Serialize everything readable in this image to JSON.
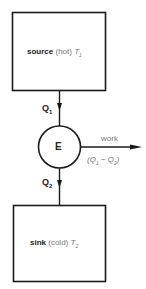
{
  "diagram": {
    "type": "heat-engine",
    "source": {
      "name": "source",
      "qualifier": "(hot)",
      "symbol": "T",
      "subscript": "1"
    },
    "heat_in": {
      "symbol": "Q",
      "subscript": "1"
    },
    "engine": {
      "label": "E"
    },
    "work": {
      "label": "work",
      "expr_open": "(",
      "q1": "Q",
      "q1_sub": "1",
      "minus": " − ",
      "q2": "Q",
      "q2_sub": "2",
      "expr_close": ")"
    },
    "heat_out": {
      "symbol": "Q",
      "subscript": "2"
    },
    "sink": {
      "name": "sink",
      "qualifier": "(cold)",
      "symbol": "T",
      "subscript": "2"
    },
    "colors": {
      "stroke": "#1a1a1a",
      "muted_text": "#777777",
      "background": "#ffffff"
    }
  }
}
